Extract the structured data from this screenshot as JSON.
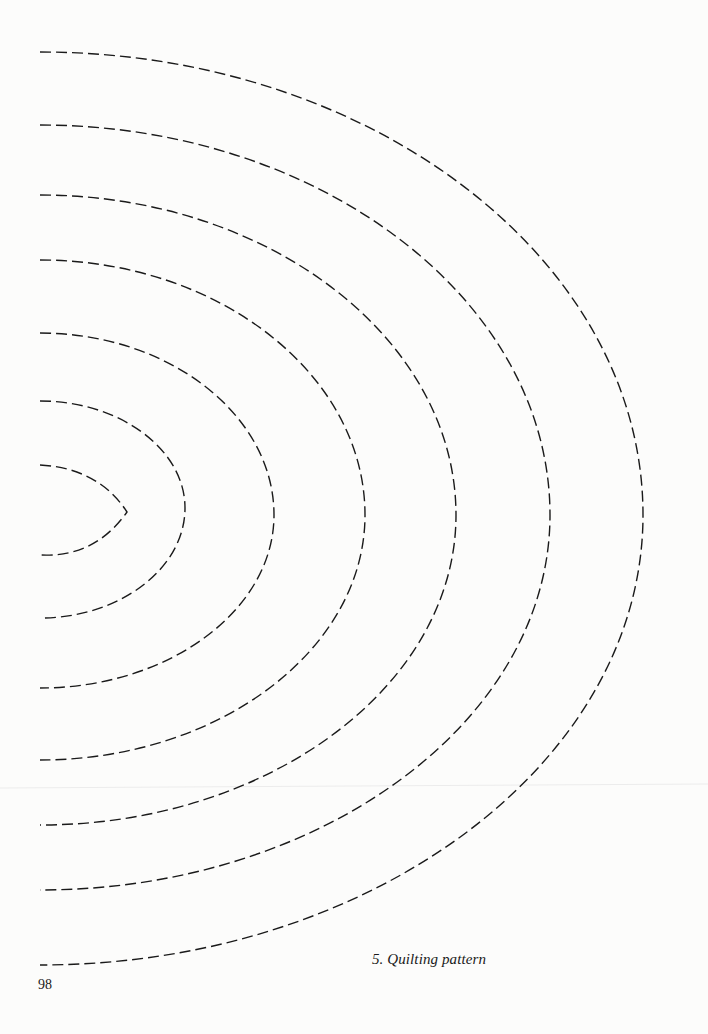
{
  "page": {
    "caption": "5. Quilting pattern",
    "page_number": "98"
  },
  "pattern": {
    "name": "nested half-arc quilting stitch lines",
    "stroke_color": "#1a1a1a",
    "line_style": "dashed",
    "arc_count": 7,
    "arcs": [
      {
        "index": 1,
        "top": [
          40,
          465
        ],
        "peak": [
          127,
          512
        ],
        "bottom": [
          40,
          555
        ],
        "shape": "pointed"
      },
      {
        "index": 2,
        "top": [
          40,
          401
        ],
        "peak": [
          185,
          508
        ],
        "bottom": [
          40,
          618
        ],
        "shape": "rounded"
      },
      {
        "index": 3,
        "top": [
          40,
          333
        ],
        "peak": [
          274,
          515
        ],
        "bottom": [
          40,
          688
        ],
        "shape": "rounded"
      },
      {
        "index": 4,
        "top": [
          40,
          260
        ],
        "peak": [
          365,
          515
        ],
        "bottom": [
          40,
          760
        ],
        "shape": "rounded"
      },
      {
        "index": 5,
        "top": [
          40,
          195
        ],
        "peak": [
          456,
          515
        ],
        "bottom": [
          40,
          825
        ],
        "shape": "rounded"
      },
      {
        "index": 6,
        "top": [
          40,
          125
        ],
        "peak": [
          550,
          515
        ],
        "bottom": [
          40,
          890
        ],
        "shape": "rounded"
      },
      {
        "index": 7,
        "top": [
          40,
          52
        ],
        "peak": [
          643,
          515
        ],
        "bottom": [
          40,
          965
        ],
        "shape": "rounded"
      }
    ]
  }
}
